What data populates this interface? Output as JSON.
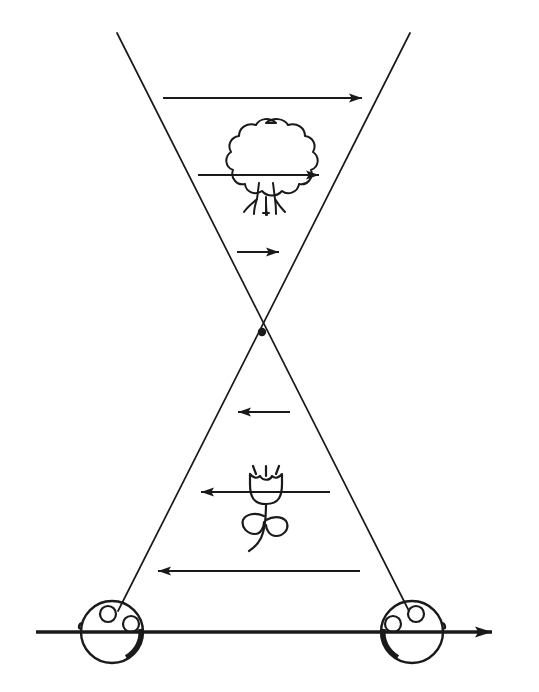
{
  "figure": {
    "background_color": "#ffffff",
    "ink_color": "#1a1a1a",
    "width": 539,
    "height": 692,
    "caption_text": "",
    "caption_visible": false
  },
  "geometry": {
    "crossing_point": {
      "x": 262,
      "y": 332,
      "dot_radius": 4
    },
    "rays": [
      {
        "name": "left-ray",
        "x1": 117,
        "y1": 33,
        "x2": 412,
        "y2": 612
      },
      {
        "name": "right-ray",
        "x1": 410,
        "y1": 33,
        "x2": 114,
        "y2": 612
      }
    ],
    "baseline": {
      "x1": 36,
      "y1": 632,
      "x2": 508,
      "y2": 632,
      "arrow": "right"
    }
  },
  "eyes": [
    {
      "name": "left-eye",
      "cx": 112,
      "cy": 632,
      "r": 31
    },
    {
      "name": "right-eye",
      "cx": 412,
      "cy": 632,
      "r": 31
    }
  ],
  "arrows": [
    {
      "id": "arrow-top",
      "label": "1",
      "x_tail": 163,
      "x_head": 368,
      "y": 98,
      "direction": "right"
    },
    {
      "id": "arrow-tree",
      "label": "2",
      "x_tail": 198,
      "x_head": 325,
      "y": 175,
      "direction": "right"
    },
    {
      "id": "arrow-upper-short",
      "label": "3",
      "x_tail": 237,
      "x_head": 285,
      "y": 252,
      "direction": "right"
    },
    {
      "id": "arrow-lower-short",
      "label": "4",
      "x_tail": 290,
      "x_head": 232,
      "y": 412,
      "direction": "left"
    },
    {
      "id": "arrow-flower",
      "label": "5",
      "x_tail": 330,
      "x_head": 195,
      "y": 492,
      "direction": "left"
    },
    {
      "id": "arrow-bottom",
      "label": "6",
      "x_tail": 360,
      "x_head": 152,
      "y": 571,
      "direction": "left"
    }
  ],
  "objects": [
    {
      "id": "tree",
      "name": "tree-drawing",
      "cx": 266,
      "cy": 165,
      "description": "bushy tree with trunk and roots"
    },
    {
      "id": "flower",
      "name": "flower-drawing",
      "cx": 266,
      "cy": 505,
      "description": "tulip with curved stem and two leaves"
    }
  ]
}
